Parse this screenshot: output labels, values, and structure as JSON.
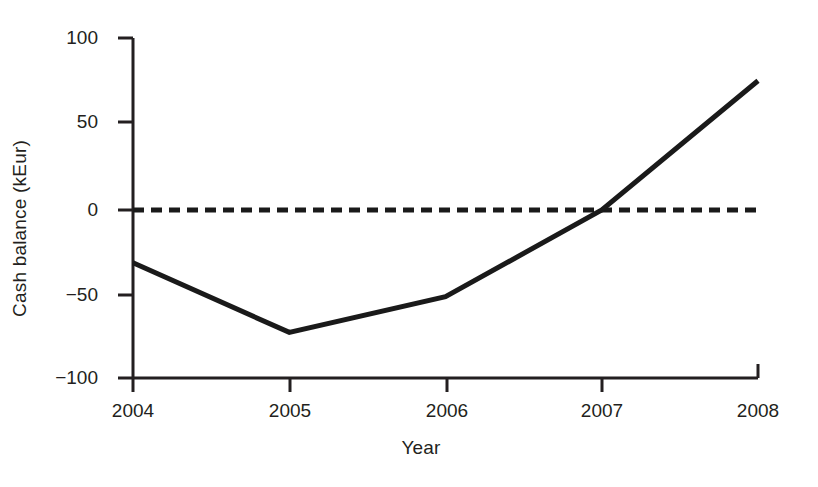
{
  "chart_data": {
    "type": "line",
    "title": "",
    "xlabel": "Year",
    "ylabel": "Cash balance (kEur)",
    "categories": [
      "2004",
      "2005",
      "2006",
      "2007",
      "2008"
    ],
    "x": [
      2004,
      2005,
      2006,
      2007,
      2008
    ],
    "xlim": [
      2004,
      2008
    ],
    "ylim": [
      -100,
      100
    ],
    "grid": false,
    "legend": null,
    "legend_position": "none",
    "yticks": [
      100,
      50,
      0,
      -50,
      -100
    ],
    "ytick_labels": [
      "100",
      "50",
      "0",
      "−50",
      "−100"
    ],
    "xticks": [
      2004,
      2005,
      2006,
      2007,
      2008
    ],
    "xtick_labels": [
      "2004",
      "2005",
      "2006",
      "2007",
      "2008"
    ],
    "series": [
      {
        "name": "Cash balance",
        "style": "solid",
        "color": "#1a1a1a",
        "linewidth": 5,
        "values": [
          -31,
          -72,
          -51,
          0,
          76
        ]
      },
      {
        "name": "Zero reference",
        "style": "dashed",
        "color": "#1a1a1a",
        "linewidth": 5,
        "values": [
          0,
          0,
          0,
          0,
          0
        ]
      }
    ],
    "annotations": []
  },
  "axes": {
    "tick_color": "#231f20",
    "spine_color": "#231f20",
    "background": "#ffffff"
  }
}
